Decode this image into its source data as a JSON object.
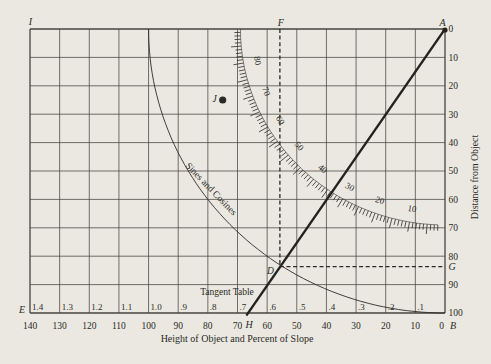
{
  "colors": {
    "background": "#eae8e1",
    "grid": "#45443e",
    "ink": "#2b2a25",
    "heavy_line": "#23221d"
  },
  "chart_data": {
    "type": "line",
    "subtype": "nomogram (height / slope / distance conversion diagram)",
    "x_axis": {
      "title": "Height of Object and Percent of Slope",
      "tick_labels": [
        "140",
        "130",
        "120",
        "110",
        "100",
        "90",
        "80",
        "70",
        "60",
        "50",
        "40",
        "30",
        "20",
        "10",
        "0"
      ],
      "tick_values": [
        140,
        130,
        120,
        110,
        100,
        90,
        80,
        70,
        60,
        50,
        40,
        30,
        20,
        10,
        0
      ],
      "range_left_to_right": [
        140,
        0
      ],
      "grid": true
    },
    "y_axis_right": {
      "title": "Distance from Object",
      "tick_labels": [
        "0",
        "10",
        "20",
        "30",
        "40",
        "50",
        "60",
        "70",
        "80",
        "90",
        "100"
      ],
      "tick_values": [
        0,
        10,
        20,
        30,
        40,
        50,
        60,
        70,
        80,
        90,
        100
      ],
      "range_top_to_bottom": [
        0,
        100
      ],
      "grid": true
    },
    "tangent_table": {
      "title": "Tangent Table",
      "values": [
        "1.4",
        "1.3",
        "1.2",
        "1.1",
        "1.0",
        ".9",
        ".8",
        ".7",
        ".6",
        ".5",
        ".4",
        ".3",
        ".2",
        ".1"
      ],
      "cell_x_values": [
        140,
        130,
        120,
        110,
        100,
        90,
        80,
        70,
        60,
        50,
        40,
        30,
        20,
        10
      ]
    },
    "degree_scale": {
      "labels": [
        "80",
        "70",
        "60",
        "50",
        "40",
        "30",
        "20",
        "10"
      ],
      "label_values_deg": [
        80,
        70,
        60,
        50,
        40,
        30,
        20,
        10
      ],
      "radius_data_units": 69,
      "center_at": {
        "x": 0,
        "dist": 0
      },
      "tick_step_deg": 1,
      "major_tick_step_deg": 5,
      "start_deg": 90,
      "end_deg": 2
    },
    "sine_cosine_curve": {
      "label": "Sines and Cosines",
      "radius_data_units": 100,
      "center_at": {
        "x": 0,
        "dist": 0
      }
    },
    "diagonal_line": {
      "from": {
        "x": 66.5,
        "dist": 100
      },
      "to": {
        "x": 0,
        "dist": 0
      }
    },
    "dashed_vertical": {
      "at_x": 55.7,
      "from_dist": 0,
      "to_dist": 83.7
    },
    "dashed_horizontal": {
      "at_dist": 83.7,
      "from_x": 55.7,
      "to_x": 0
    },
    "points": {
      "J": {
        "label": "J",
        "x": 75,
        "dist": 25
      },
      "D": {
        "label": "D",
        "x": 55.7,
        "dist": 83.7
      }
    },
    "corner_labels": {
      "top_left": "I",
      "top_mid": "F",
      "top_right": "A",
      "bottom_left": "E",
      "bottom_mid": "H",
      "bottom_right": "B",
      "right_mid": "G"
    }
  }
}
